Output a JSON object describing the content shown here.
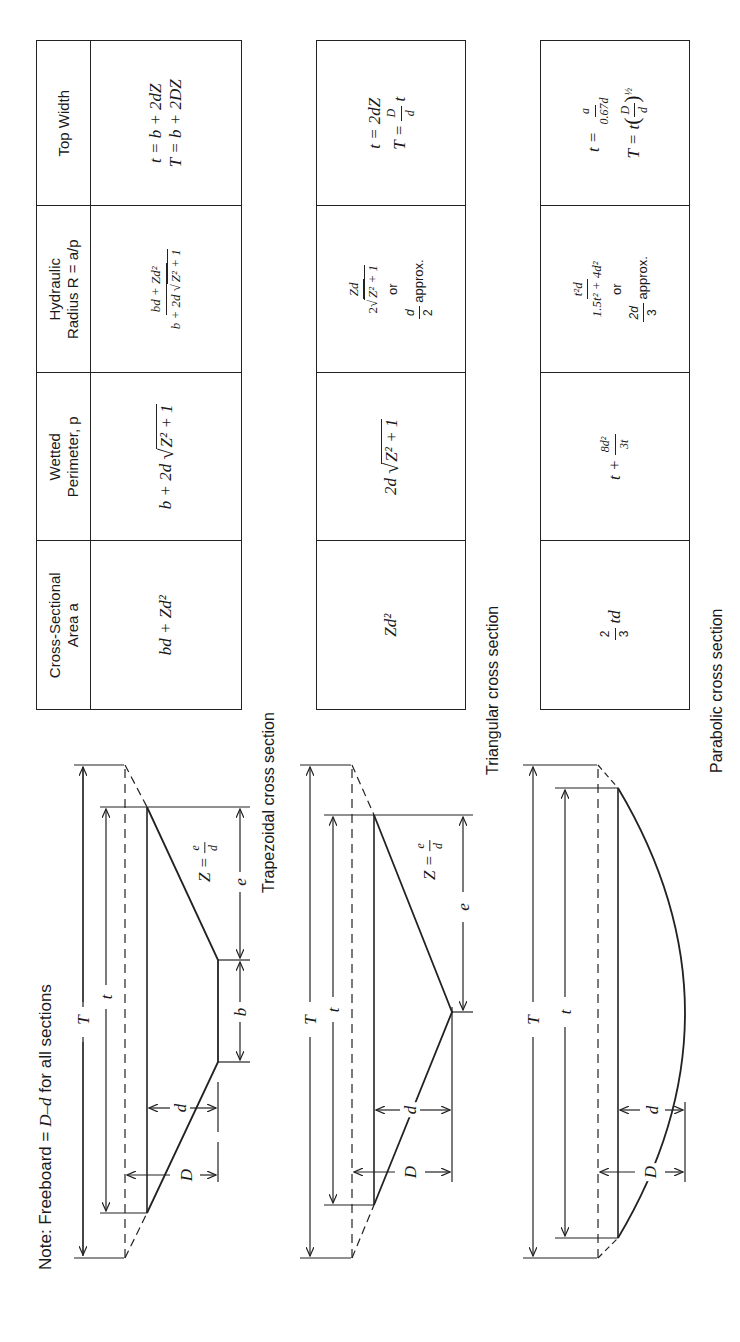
{
  "note": {
    "prefix": "Note: Freeboard = ",
    "expr": "D–d",
    "suffix": " for all sections"
  },
  "table_header": {
    "columns": [
      {
        "line1": "Cross-Sectional",
        "line2": "Area a"
      },
      {
        "line1": "Wetted",
        "line2": "Perimeter, p"
      },
      {
        "line1": "Hydraulic",
        "line2": "Radius R = a/p"
      },
      {
        "line1": "Top Width",
        "line2": ""
      }
    ]
  },
  "sections": [
    {
      "caption": "Trapezoidal cross section",
      "area": "bd + Zd²",
      "wetted_perimeter": {
        "pre": "b + 2d",
        "radicand": "Z² + 1"
      },
      "hydraulic_radius": {
        "num": "bd + Zd²",
        "den_pre": "b + 2d",
        "den_radicand": "Z² + 1"
      },
      "top_width": {
        "line1": "t = b + 2dZ",
        "line2": "T = b + 2DZ"
      }
    },
    {
      "caption": "Triangular cross section",
      "area": "Zd²",
      "wetted_perimeter": {
        "pre": "2d",
        "radicand": "Z² + 1"
      },
      "hydraulic_radius": {
        "num": "Zd",
        "den_pre": "2",
        "den_radicand": "Z² + 1",
        "or": "or",
        "approx_num": "d",
        "approx_den": "2",
        "approx_suffix": "approx."
      },
      "top_width": {
        "line1": "t = 2dZ",
        "line2_pre": "T = ",
        "line2_num": "D",
        "line2_den": "d",
        "line2_suffix": "t"
      }
    },
    {
      "caption": "Parabolic cross section",
      "area": {
        "num": "2",
        "den": "3",
        "suffix": "td"
      },
      "wetted_perimeter": {
        "pre": "t + ",
        "num": "8d²",
        "den": "3t"
      },
      "hydraulic_radius": {
        "num": "t²d",
        "den": "1.5t² + 4d²",
        "or": "or",
        "approx_num": "2d",
        "approx_den": "3",
        "approx_suffix": "approx."
      },
      "top_width": {
        "line1_pre": "t = ",
        "line1_num": "a",
        "line1_den": "0.67d",
        "line2_pre": "T = t",
        "line2_num": "D",
        "line2_den": "d",
        "line2_exp": "½"
      }
    }
  ],
  "diagram_labels": {
    "T": "T",
    "t": "t",
    "d": "d",
    "D": "D",
    "b": "b",
    "e": "e",
    "Z_pre": "Z =",
    "Z_num": "e",
    "Z_den": "d"
  }
}
